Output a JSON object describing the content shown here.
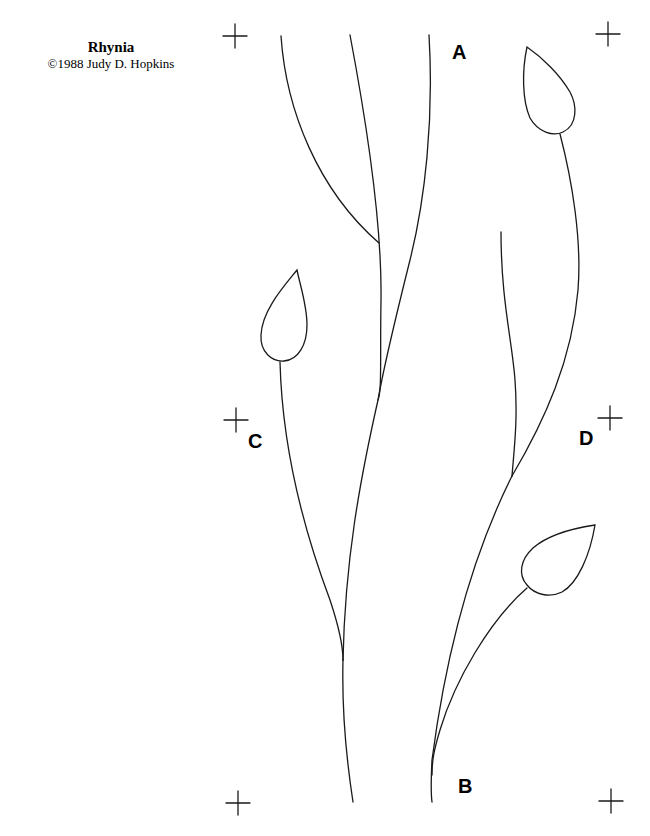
{
  "pattern": {
    "title": "Rhynia",
    "copyright": "©1988 Judy D. Hopkins"
  },
  "labels": {
    "a": "A",
    "b": "B",
    "c": "C",
    "d": "D"
  },
  "registration_marks": [
    {
      "name": "top-left",
      "x": 235,
      "y": 36
    },
    {
      "name": "top-right",
      "x": 608,
      "y": 34
    },
    {
      "name": "middle-left",
      "x": 236,
      "y": 420
    },
    {
      "name": "middle-right",
      "x": 610,
      "y": 418
    },
    {
      "name": "bottom-left",
      "x": 238,
      "y": 803
    },
    {
      "name": "bottom-right",
      "x": 611,
      "y": 801
    }
  ],
  "colors": {
    "line": "#1a1a1a",
    "background": "#ffffff"
  }
}
